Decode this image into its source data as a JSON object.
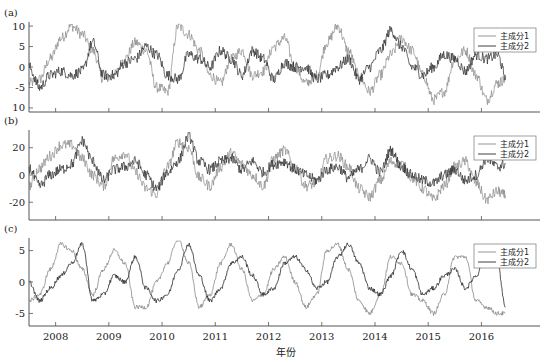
{
  "xlabel": "年份",
  "legend": [
    "主成分1",
    "主成分2"
  ],
  "colors": {
    "series1": "#8a8a8a",
    "series2": "#2b2b2b",
    "axis": "#555555"
  },
  "chart_data": [
    {
      "type": "line",
      "panel": "(a)",
      "title": "",
      "xlabel": "年份",
      "ylabel": "",
      "xlim": [
        2007.5,
        2017.1
      ],
      "ylim": [
        -11,
        11
      ],
      "yticks": [
        10,
        5,
        0,
        -5,
        -10
      ],
      "ytick_labels": [
        "10",
        "5",
        "0",
        "-5",
        "10"
      ],
      "xticks": [
        2008,
        2009,
        2010,
        2011,
        2012,
        2013,
        2014,
        2015,
        2016
      ],
      "legend_position": "upper right",
      "series": [
        {
          "name": "主成分1",
          "x": [
            2007.5,
            2007.7,
            2007.9,
            2008.1,
            2008.3,
            2008.5,
            2008.7,
            2008.9,
            2009.1,
            2009.3,
            2009.5,
            2009.7,
            2009.9,
            2010.1,
            2010.3,
            2010.5,
            2010.7,
            2010.9,
            2011.1,
            2011.3,
            2011.5,
            2011.7,
            2011.9,
            2012.1,
            2012.3,
            2012.5,
            2012.7,
            2012.9,
            2013.1,
            2013.3,
            2013.5,
            2013.7,
            2013.9,
            2014.1,
            2014.3,
            2014.5,
            2014.7,
            2014.9,
            2015.1,
            2015.3,
            2015.5,
            2015.7,
            2015.9,
            2016.1,
            2016.3,
            2016.45
          ],
          "values": [
            -4,
            -3,
            2,
            7,
            10,
            8,
            4,
            -3,
            -2,
            2,
            6,
            4,
            -5,
            -6,
            10,
            8,
            4,
            -2,
            -4,
            2,
            4,
            -2,
            -1,
            5,
            7,
            0,
            -4,
            -2,
            6,
            10,
            4,
            -2,
            -6,
            -2,
            3,
            7,
            4,
            -2,
            -8,
            -6,
            2,
            4,
            -2,
            -8,
            -4,
            -3
          ]
        },
        {
          "name": "主成分2",
          "x": [
            2007.5,
            2007.7,
            2007.9,
            2008.1,
            2008.3,
            2008.5,
            2008.7,
            2008.9,
            2009.1,
            2009.3,
            2009.5,
            2009.7,
            2009.9,
            2010.1,
            2010.3,
            2010.5,
            2010.7,
            2010.9,
            2011.1,
            2011.3,
            2011.5,
            2011.7,
            2011.9,
            2012.1,
            2012.3,
            2012.5,
            2012.7,
            2012.9,
            2013.1,
            2013.3,
            2013.5,
            2013.7,
            2013.9,
            2014.1,
            2014.3,
            2014.5,
            2014.7,
            2014.9,
            2015.1,
            2015.3,
            2015.5,
            2015.7,
            2015.9,
            2016.1,
            2016.3,
            2016.45
          ],
          "values": [
            0,
            -5,
            -2,
            -1,
            -2,
            -1,
            6,
            -2,
            -2,
            1,
            2,
            5,
            3,
            -2,
            -3,
            3,
            2,
            0,
            4,
            2,
            -2,
            4,
            2,
            -3,
            1,
            0,
            0,
            -3,
            -2,
            0,
            2,
            -3,
            0,
            4,
            9,
            5,
            0,
            -2,
            0,
            3,
            2,
            -1,
            3,
            2,
            3,
            -2
          ]
        }
      ]
    },
    {
      "type": "line",
      "panel": "(b)",
      "title": "",
      "xlabel": "年份",
      "ylabel": "",
      "xlim": [
        2007.5,
        2017.1
      ],
      "ylim": [
        -33,
        33
      ],
      "yticks": [
        20,
        0,
        -20
      ],
      "ytick_labels": [
        "20",
        "0",
        "-20"
      ],
      "xticks": [
        2008,
        2009,
        2010,
        2011,
        2012,
        2013,
        2014,
        2015,
        2016
      ],
      "legend_position": "upper right",
      "series": [
        {
          "name": "主成分1",
          "x": [
            2007.5,
            2007.7,
            2007.9,
            2008.1,
            2008.3,
            2008.5,
            2008.7,
            2008.9,
            2009.1,
            2009.3,
            2009.5,
            2009.7,
            2009.9,
            2010.1,
            2010.3,
            2010.5,
            2010.7,
            2010.9,
            2011.1,
            2011.3,
            2011.5,
            2011.7,
            2011.9,
            2012.1,
            2012.3,
            2012.5,
            2012.7,
            2012.9,
            2013.1,
            2013.3,
            2013.5,
            2013.7,
            2013.9,
            2014.1,
            2014.3,
            2014.5,
            2014.7,
            2014.9,
            2015.1,
            2015.3,
            2015.5,
            2015.7,
            2015.9,
            2016.1,
            2016.3,
            2016.45
          ],
          "values": [
            -8,
            5,
            14,
            22,
            22,
            12,
            0,
            -8,
            12,
            16,
            2,
            -10,
            -14,
            6,
            24,
            20,
            -2,
            -8,
            6,
            16,
            8,
            0,
            -8,
            12,
            18,
            6,
            -8,
            -6,
            12,
            14,
            6,
            -10,
            -16,
            -4,
            10,
            8,
            -2,
            -10,
            -18,
            -8,
            6,
            10,
            -6,
            -18,
            -12,
            -15
          ]
        },
        {
          "name": "主成分2",
          "x": [
            2007.5,
            2007.7,
            2007.9,
            2008.1,
            2008.3,
            2008.5,
            2008.7,
            2008.9,
            2009.1,
            2009.3,
            2009.5,
            2009.7,
            2009.9,
            2010.1,
            2010.3,
            2010.5,
            2010.7,
            2010.9,
            2011.1,
            2011.3,
            2011.5,
            2011.7,
            2011.9,
            2012.1,
            2012.3,
            2012.5,
            2012.7,
            2012.9,
            2013.1,
            2013.3,
            2013.5,
            2013.7,
            2013.9,
            2014.1,
            2014.3,
            2014.5,
            2014.7,
            2014.9,
            2015.1,
            2015.3,
            2015.5,
            2015.7,
            2015.9,
            2016.1,
            2016.3,
            2016.45
          ],
          "values": [
            5,
            -8,
            0,
            4,
            8,
            25,
            10,
            -4,
            4,
            6,
            10,
            0,
            -10,
            2,
            10,
            28,
            10,
            4,
            10,
            12,
            4,
            10,
            2,
            8,
            10,
            4,
            0,
            -4,
            4,
            6,
            -2,
            4,
            12,
            2,
            18,
            6,
            0,
            -4,
            -6,
            0,
            4,
            -4,
            0,
            12,
            6,
            8
          ]
        }
      ]
    },
    {
      "type": "line",
      "panel": "(c)",
      "title": "",
      "xlabel": "年份",
      "ylabel": "",
      "xlim": [
        2007.5,
        2017.1
      ],
      "ylim": [
        -7,
        7
      ],
      "yticks": [
        5,
        0,
        -5
      ],
      "ytick_labels": [
        "5",
        "0",
        "-5"
      ],
      "xticks": [
        2008,
        2009,
        2010,
        2011,
        2012,
        2013,
        2014,
        2015,
        2016
      ],
      "xtick_labels": [
        "2008",
        "2009",
        "2010",
        "2011",
        "2012",
        "2013",
        "2014",
        "2015",
        "2016"
      ],
      "legend_position": "upper right",
      "series": [
        {
          "name": "主成分1",
          "x": [
            2007.5,
            2007.7,
            2007.9,
            2008.1,
            2008.3,
            2008.5,
            2008.7,
            2008.9,
            2009.1,
            2009.3,
            2009.5,
            2009.7,
            2009.9,
            2010.1,
            2010.3,
            2010.5,
            2010.7,
            2010.9,
            2011.1,
            2011.3,
            2011.5,
            2011.7,
            2011.9,
            2012.1,
            2012.3,
            2012.5,
            2012.7,
            2012.9,
            2013.1,
            2013.3,
            2013.5,
            2013.7,
            2013.9,
            2014.1,
            2014.3,
            2014.5,
            2014.7,
            2014.9,
            2015.1,
            2015.3,
            2015.5,
            2015.7,
            2015.9,
            2016.1,
            2016.3,
            2016.45
          ],
          "values": [
            -3,
            -2,
            2,
            6,
            5,
            2,
            -2,
            2,
            5,
            3,
            -4,
            -4,
            0,
            3,
            7,
            3,
            -4,
            -2,
            3,
            6,
            2,
            -3,
            -2,
            2,
            4,
            0,
            -4,
            -2,
            5,
            6,
            2,
            -3,
            -5,
            -2,
            4,
            3,
            -2,
            -3,
            -5,
            -2,
            4,
            4,
            -3,
            -4,
            -5,
            -5
          ]
        },
        {
          "name": "主成分2",
          "x": [
            2007.5,
            2007.7,
            2007.9,
            2008.1,
            2008.3,
            2008.5,
            2008.7,
            2008.9,
            2009.1,
            2009.3,
            2009.5,
            2009.7,
            2009.9,
            2010.1,
            2010.3,
            2010.5,
            2010.7,
            2010.9,
            2011.1,
            2011.3,
            2011.5,
            2011.7,
            2011.9,
            2012.1,
            2012.3,
            2012.5,
            2012.7,
            2012.9,
            2013.1,
            2013.3,
            2013.5,
            2013.7,
            2013.9,
            2014.1,
            2014.3,
            2014.5,
            2014.7,
            2014.9,
            2015.1,
            2015.3,
            2015.5,
            2015.7,
            2015.9,
            2016.1,
            2016.3,
            2016.45
          ],
          "values": [
            0,
            -3,
            -1,
            1,
            3,
            6,
            -3,
            -2,
            1,
            0,
            4,
            -1,
            -3,
            -2,
            2,
            6,
            1,
            -3,
            -1,
            3,
            4,
            1,
            -2,
            -1,
            3,
            4,
            2,
            -1,
            0,
            4,
            6,
            3,
            -1,
            -2,
            1,
            5,
            2,
            -2,
            -1,
            1,
            2,
            -1,
            1,
            5,
            3,
            -4
          ]
        }
      ]
    }
  ]
}
